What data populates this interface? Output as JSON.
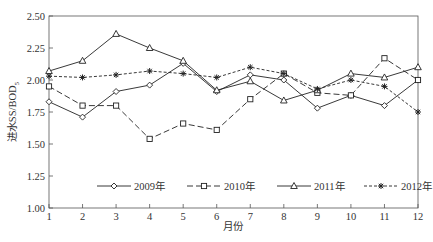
{
  "chart_data": {
    "type": "line",
    "title": "",
    "xlabel": "月份",
    "ylabel": "进水SS/BOD5",
    "ylabel_main": "进水SS/BOD",
    "ylabel_sub": "5",
    "x": [
      1,
      2,
      3,
      4,
      5,
      6,
      7,
      8,
      9,
      10,
      11,
      12
    ],
    "xlim": [
      1,
      12
    ],
    "ylim": [
      1.0,
      2.5
    ],
    "yticks": [
      "1.00",
      "1.25",
      "1.50",
      "1.75",
      "2.00",
      "2.25",
      "2.50"
    ],
    "xticks": [
      "1",
      "2",
      "3",
      "4",
      "5",
      "6",
      "7",
      "8",
      "9",
      "10",
      "11",
      "12"
    ],
    "grid": false,
    "legend_position": "inside-bottom",
    "series": [
      {
        "name": "2009年",
        "marker": "diamond",
        "dash": "solid",
        "values": [
          1.83,
          1.71,
          1.91,
          1.96,
          2.13,
          1.91,
          2.04,
          2.0,
          1.78,
          1.88,
          1.8,
          2.0
        ]
      },
      {
        "name": "2010年",
        "marker": "square",
        "dash": "longdash",
        "values": [
          1.95,
          1.8,
          1.8,
          1.54,
          1.66,
          1.61,
          1.85,
          2.05,
          1.9,
          1.88,
          2.17,
          2.0
        ]
      },
      {
        "name": "2011年",
        "marker": "triangle",
        "dash": "solid",
        "values": [
          2.07,
          2.15,
          2.36,
          2.25,
          2.15,
          1.92,
          1.99,
          1.84,
          1.92,
          2.05,
          2.02,
          2.1
        ]
      },
      {
        "name": "2012年",
        "marker": "star",
        "dash": "shortdash",
        "values": [
          2.03,
          2.02,
          2.04,
          2.07,
          2.05,
          2.02,
          2.1,
          2.05,
          1.93,
          2.0,
          1.95,
          1.75
        ]
      }
    ]
  }
}
